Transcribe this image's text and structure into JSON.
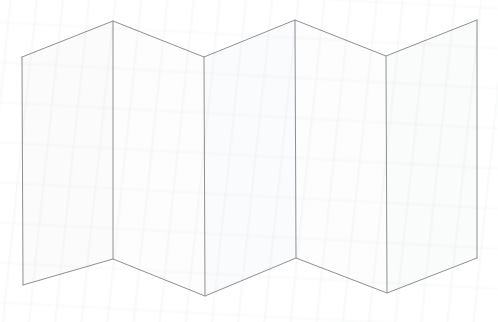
{
  "figure": {
    "panel_count": 5,
    "fold_count": 4,
    "style": "line-art",
    "background_color": "#ffffff",
    "stroke_color": "#8f9094",
    "stroke_width": 1,
    "panel_fill_light": "#fdfdfd",
    "panel_fill_shade": "#f7f8f9",
    "canvas": {
      "width": 498,
      "height": 322
    }
  },
  "geometry": {
    "top_vertices": [
      {
        "name": "left-edge-top",
        "x": 22,
        "y": 57
      },
      {
        "name": "fold-1-top",
        "x": 113,
        "y": 21
      },
      {
        "name": "fold-2-top",
        "x": 204,
        "y": 57
      },
      {
        "name": "fold-3-top",
        "x": 295,
        "y": 20
      },
      {
        "name": "fold-4-top",
        "x": 386,
        "y": 56
      },
      {
        "name": "right-edge-top",
        "x": 477,
        "y": 20
      }
    ],
    "bottom_vertices": [
      {
        "name": "left-edge-bottom",
        "x": 23,
        "y": 285
      },
      {
        "name": "fold-1-bottom",
        "x": 113,
        "y": 259
      },
      {
        "name": "fold-2-bottom",
        "x": 205,
        "y": 296
      },
      {
        "name": "fold-3-bottom",
        "x": 296,
        "y": 258
      },
      {
        "name": "fold-4-bottom",
        "x": 387,
        "y": 293
      },
      {
        "name": "right-edge-bottom",
        "x": 477,
        "y": 258
      }
    ],
    "panels": [
      {
        "name": "panel-1",
        "points": "22,57 113,21 113,259 23,285",
        "fill": "#fbfbfc",
        "orientation": "front"
      },
      {
        "name": "panel-2",
        "points": "113,21 204,57 205,296 113,259",
        "fill": "#fdfdfd",
        "orientation": "back"
      },
      {
        "name": "panel-3",
        "points": "204,57 295,20 296,258 205,296",
        "fill": "#fafbfc",
        "orientation": "front"
      },
      {
        "name": "panel-4",
        "points": "295,20 386,56 387,293 296,258",
        "fill": "#fdfdfd",
        "orientation": "back"
      },
      {
        "name": "panel-5",
        "points": "386,56 477,20 477,258 387,293",
        "fill": "#fafbfb",
        "orientation": "front"
      }
    ],
    "fold_lines": [
      {
        "name": "fold-line-1",
        "x1": 113,
        "y1": 21,
        "x2": 113,
        "y2": 259
      },
      {
        "name": "fold-line-2",
        "x1": 204,
        "y1": 57,
        "x2": 205,
        "y2": 296
      },
      {
        "name": "fold-line-3",
        "x1": 295,
        "y1": 20,
        "x2": 296,
        "y2": 258
      },
      {
        "name": "fold-line-4",
        "x1": 386,
        "y1": 56,
        "x2": 387,
        "y2": 293
      }
    ],
    "edge_lines": [
      {
        "name": "left-edge",
        "x1": 22,
        "y1": 57,
        "x2": 23,
        "y2": 285
      },
      {
        "name": "right-edge",
        "x1": 477,
        "y1": 20,
        "x2": 477,
        "y2": 258
      }
    ],
    "top_outline": "22,57 113,21 204,57 295,20 386,56 477,20",
    "bottom_outline": "23,285 113,259 205,296 296,258 387,293 477,258"
  }
}
